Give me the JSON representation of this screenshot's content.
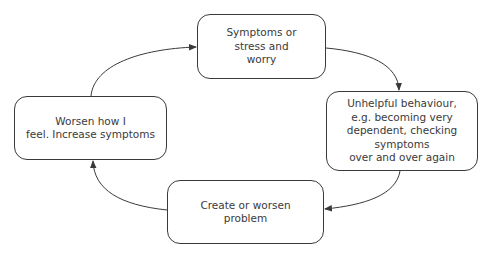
{
  "diagram": {
    "type": "cycle",
    "nodes": [
      {
        "id": "top",
        "label": "Symptoms or\nstress and\nworry"
      },
      {
        "id": "right",
        "label": "Unhelpful behaviour,\ne.g. becoming very\ndependent, checking symptoms\nover and over again"
      },
      {
        "id": "bottom",
        "label": "Create or worsen\nproblem"
      },
      {
        "id": "left",
        "label": "Worsen how I\nfeel. Increase symptoms"
      }
    ],
    "edges": [
      {
        "from": "top",
        "to": "right"
      },
      {
        "from": "right",
        "to": "bottom"
      },
      {
        "from": "bottom",
        "to": "left"
      },
      {
        "from": "left",
        "to": "top"
      }
    ],
    "colors": {
      "stroke": "#3a3a3a",
      "text": "#3a3a3a",
      "background": "#ffffff"
    }
  }
}
